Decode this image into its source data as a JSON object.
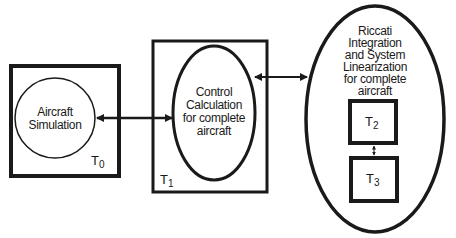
{
  "diagram": {
    "nodes": {
      "t0_box": {
        "task": "T",
        "sub": "0"
      },
      "t1_box": {
        "task": "T",
        "sub": "1"
      },
      "t2_box": {
        "task": "T",
        "sub": "2"
      },
      "t3_box": {
        "task": "T",
        "sub": "3"
      },
      "aircraft_sim": {
        "line1": "Aircraft",
        "line2": "Simulation"
      },
      "control_calc": {
        "line1": "Control",
        "line2": "Calculation",
        "line3": "for complete",
        "line4": "aircraft"
      },
      "riccati": {
        "line1": "Riccati",
        "line2": "Integration",
        "line3": "and System",
        "line4": "Linearization",
        "line5": "for complete",
        "line6": "aircraft"
      }
    },
    "edges": [
      {
        "from": "aircraft_sim",
        "to": "control_calc",
        "type": "bidirectional"
      },
      {
        "from": "control_calc",
        "to": "riccati",
        "type": "bidirectional"
      },
      {
        "from": "t2_box",
        "to": "t3_box",
        "type": "bidirectional"
      }
    ],
    "colors": {
      "stroke": "#1a1a1a",
      "background": "#ffffff"
    }
  }
}
